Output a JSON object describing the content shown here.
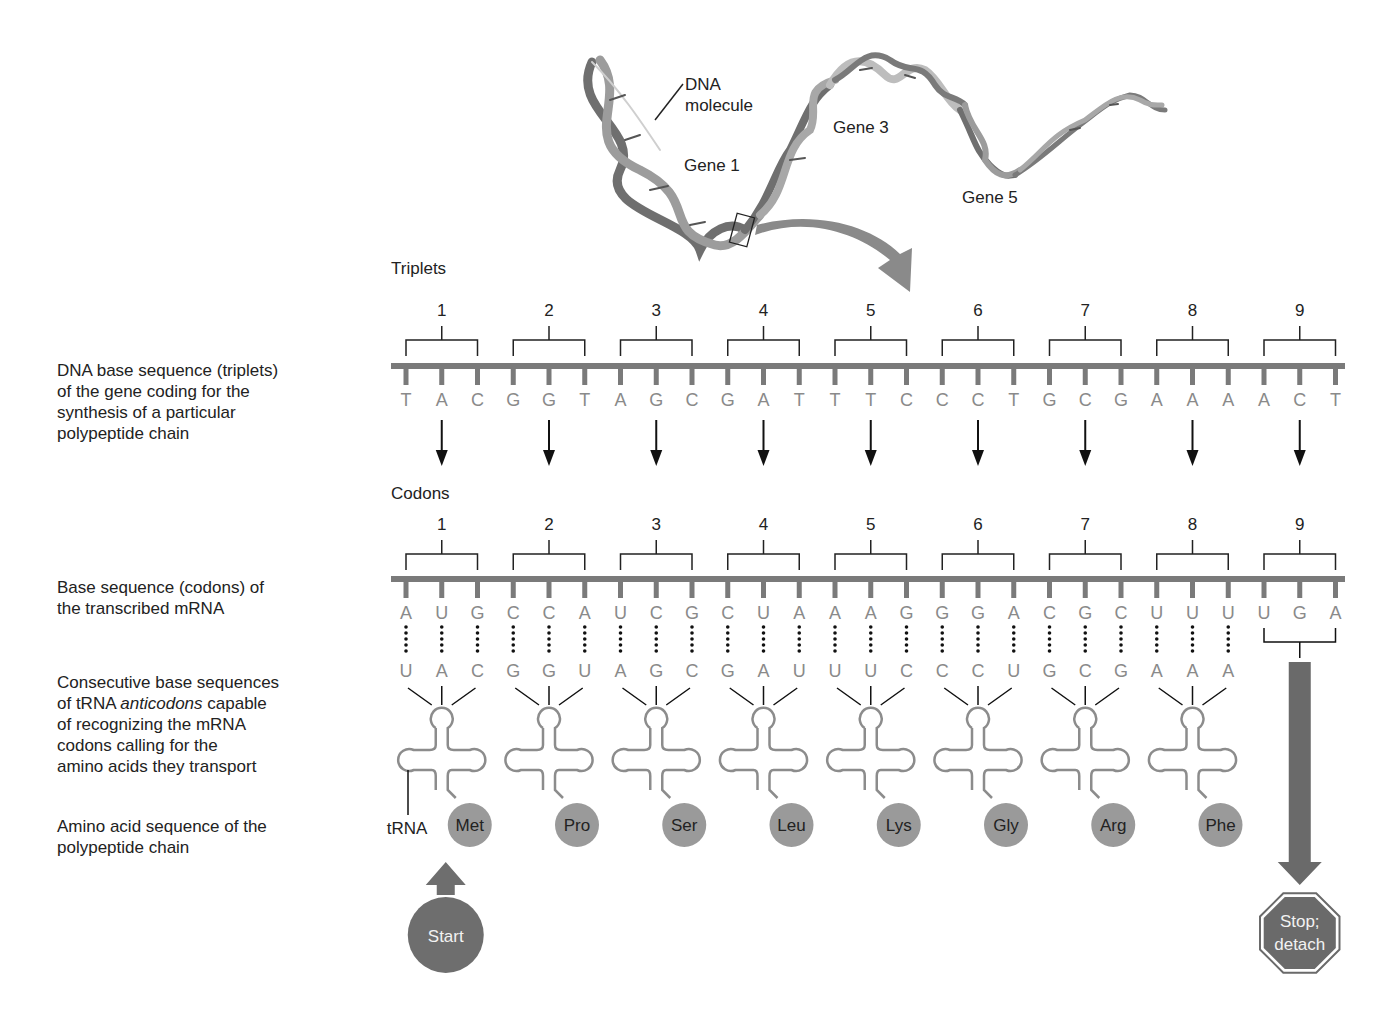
{
  "dna_molecule": {
    "label": "DNA\nmolecule",
    "genes": [
      "Gene 1",
      "Gene 3",
      "Gene 5"
    ]
  },
  "side_labels": {
    "dna": "DNA base sequence (triplets)\nof the gene coding for the\nsynthesis of a particular\npolypeptide chain",
    "mrna": "Base sequence (codons) of\nthe transcribed mRNA",
    "trna_line1": "Consecutive base sequences",
    "trna_line2_pre": "of tRNA ",
    "trna_line2_em": "anticodons",
    "trna_line2_post": " capable",
    "trna_rest": "of recognizing the mRNA\ncodons calling for the\namino acids they transport",
    "amino": "Amino acid sequence of the\npolypeptide chain"
  },
  "sections": {
    "triplets_title": "Triplets",
    "codons_title": "Codons"
  },
  "group_numbers": [
    "1",
    "2",
    "3",
    "4",
    "5",
    "6",
    "7",
    "8",
    "9"
  ],
  "dna_bases": [
    "T",
    "A",
    "C",
    "G",
    "G",
    "T",
    "A",
    "G",
    "C",
    "G",
    "A",
    "T",
    "T",
    "T",
    "C",
    "C",
    "C",
    "T",
    "G",
    "C",
    "G",
    "A",
    "A",
    "A",
    "A",
    "C",
    "T"
  ],
  "mrna_bases": [
    "A",
    "U",
    "G",
    "C",
    "C",
    "A",
    "U",
    "C",
    "G",
    "C",
    "U",
    "A",
    "A",
    "A",
    "G",
    "G",
    "G",
    "A",
    "C",
    "G",
    "C",
    "U",
    "U",
    "U",
    "U",
    "G",
    "A"
  ],
  "anticodon_bases": [
    "U",
    "A",
    "C",
    "G",
    "G",
    "U",
    "A",
    "G",
    "C",
    "G",
    "A",
    "U",
    "U",
    "U",
    "C",
    "C",
    "C",
    "U",
    "G",
    "C",
    "G",
    "A",
    "A",
    "A"
  ],
  "amino_acids": [
    "Met",
    "Pro",
    "Ser",
    "Leu",
    "Lys",
    "Gly",
    "Arg",
    "Phe"
  ],
  "trna_label": "tRNA",
  "start_label": "Start",
  "stop_label_line1": "Stop;",
  "stop_label_line2": "detach",
  "colors": {
    "strand": "#7a7a7a",
    "base_text": "#8a8a8a",
    "trna": "#8c8c8c",
    "amino_circle": "#9a9a9a",
    "start_circle": "#6e6e6e",
    "stop_octagon": "#6a6a6a",
    "arrow": "#8a8a8a"
  }
}
